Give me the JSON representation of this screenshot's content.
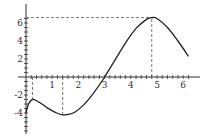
{
  "chart_data": {
    "type": "line",
    "title": "",
    "xlabel": "",
    "ylabel": "",
    "x_ticks": [
      "1",
      "2",
      "3",
      "4",
      "5",
      "6"
    ],
    "y_ticks": [
      "6",
      "4",
      "2",
      "-2",
      "-4"
    ],
    "xlim": [
      0,
      6.5
    ],
    "ylim": [
      -6,
      7.5
    ],
    "grid": false,
    "legend": "none",
    "series": [
      {
        "name": "f(x)",
        "x": [
          0.0,
          0.1,
          0.25,
          0.5,
          0.8,
          1.1,
          1.4,
          1.8,
          2.2,
          2.6,
          3.0,
          3.4,
          3.8,
          4.2,
          4.6,
          4.8,
          5.0,
          5.4,
          5.8,
          6.2
        ],
        "y": [
          -4.0,
          -3.0,
          -2.5,
          -2.8,
          -3.4,
          -3.9,
          -4.2,
          -4.0,
          -3.1,
          -1.7,
          0.0,
          1.9,
          3.8,
          5.4,
          6.4,
          6.6,
          6.5,
          5.5,
          4.0,
          2.3
        ]
      }
    ],
    "annotations": [
      {
        "type": "dashed-vertical",
        "x": 0.25,
        "from_y": 0,
        "to_y": -2.5,
        "label": "local max"
      },
      {
        "type": "dashed-vertical",
        "x": 1.4,
        "from_y": 0,
        "to_y": -4.2,
        "label": "local min"
      },
      {
        "type": "dashed-vertical",
        "x": 4.8,
        "from_y": 0,
        "to_y": 6.6,
        "label": "max"
      },
      {
        "type": "dashed-horizontal",
        "y": 6.6,
        "from_x": 0,
        "to_x": 4.8,
        "label": "max value"
      }
    ]
  }
}
